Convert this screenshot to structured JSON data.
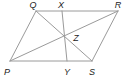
{
  "diagram": {
    "type": "geometry",
    "stroke_color": "#9a9a9a",
    "label_color": "#222222",
    "points": {
      "Q": {
        "label": "Q",
        "x": 36,
        "y": 11,
        "lx": 33,
        "ly": 5
      },
      "X": {
        "label": "X",
        "x": 62,
        "y": 11,
        "lx": 61,
        "ly": 5
      },
      "R": {
        "label": "R",
        "x": 118,
        "y": 11,
        "lx": 118,
        "ly": 5
      },
      "Z": {
        "label": "Z",
        "x": 64,
        "y": 36,
        "lx": 76,
        "ly": 38
      },
      "P": {
        "label": "P",
        "x": 10,
        "y": 61,
        "lx": 7,
        "ly": 72
      },
      "Y": {
        "label": "Y",
        "x": 67,
        "y": 61,
        "lx": 67,
        "ly": 72
      },
      "S": {
        "label": "S",
        "x": 92,
        "y": 61,
        "lx": 92,
        "ly": 72
      }
    },
    "segments": [
      [
        "Q",
        "R"
      ],
      [
        "R",
        "S"
      ],
      [
        "S",
        "P"
      ],
      [
        "P",
        "Q"
      ],
      [
        "P",
        "R"
      ],
      [
        "Q",
        "S"
      ],
      [
        "X",
        "Y"
      ]
    ]
  }
}
